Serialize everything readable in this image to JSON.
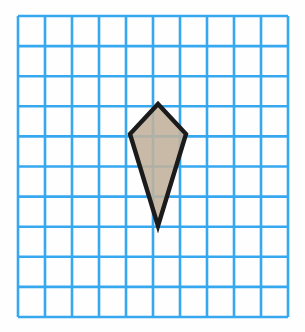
{
  "figure": {
    "canvas": {
      "width": 305,
      "height": 332,
      "background": "#fefefe"
    },
    "grid": {
      "label": "square grid",
      "columns": 10,
      "rows": 10,
      "line_color": "#36a8f0",
      "line_width": 2.6,
      "origin_x": 18,
      "origin_y": 16,
      "cell_width": 27.0,
      "cell_height": 30.1
    },
    "shape": {
      "name": "kite",
      "type": "polygon",
      "vertex_count": 4,
      "fill_color": "#c0b09b",
      "fill_opacity": 0.88,
      "stroke_color": "#1b1b1b",
      "stroke_width": 4.4,
      "points": "158,104 186,134 158,226 130,134",
      "vertices": [
        {
          "name": "top",
          "x": 158,
          "y": 104,
          "grid_col": 5,
          "grid_row": 3
        },
        {
          "name": "right",
          "x": 186,
          "y": 134,
          "grid_col": 6,
          "grid_row": 4
        },
        {
          "name": "bottom",
          "x": 158,
          "y": 226,
          "grid_col": 5,
          "grid_row": 7
        },
        {
          "name": "left",
          "x": 130,
          "y": 134,
          "grid_col": 4,
          "grid_row": 4
        }
      ],
      "diagonal_horizontal_cells": 2,
      "diagonal_vertical_cells": 4
    }
  },
  "chart_data": {
    "type": "scatter",
    "xlabel": "",
    "ylabel": "",
    "xlim": [
      0,
      10
    ],
    "ylim": [
      0,
      10
    ],
    "grid": true,
    "legend": "none",
    "series": [
      {
        "name": "kite",
        "closed": true,
        "x": [
          5,
          6,
          5,
          4
        ],
        "y": [
          7,
          6,
          3,
          6
        ]
      }
    ],
    "annotations": []
  }
}
